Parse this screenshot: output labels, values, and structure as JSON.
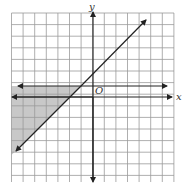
{
  "chart_data": {
    "type": "inequality-graph",
    "title": "",
    "xlabel": "x",
    "ylabel": "y",
    "origin_label": "O",
    "xlim": [
      -7,
      7
    ],
    "ylim": [
      -7.5,
      7.5
    ],
    "grid": true,
    "grid_step": 1,
    "lines": [
      {
        "name": "diagonal",
        "equation": "y = x + 2",
        "slope": 1,
        "intercept": 2,
        "style": "solid",
        "arrows": "both"
      },
      {
        "name": "horizontal",
        "equation": "y = 1",
        "slope": 0,
        "intercept": 1,
        "style": "solid",
        "arrows": "both"
      }
    ],
    "shaded_region": {
      "description": "y <= 1 and y >= x + 2",
      "color": "#c8c8c8"
    },
    "note": "Intercepts and grid scale estimated from pixel positions; values approximate"
  },
  "colors": {
    "grid": "#9a9a9a",
    "axis": "#222222",
    "line": "#222222",
    "shade": "#c8c8c8"
  }
}
